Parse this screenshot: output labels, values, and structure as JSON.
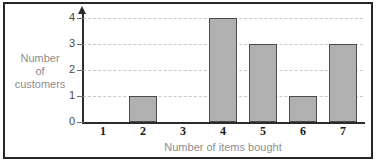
{
  "chart_data": {
    "type": "bar",
    "title": "",
    "categories": [
      "1",
      "2",
      "3",
      "4",
      "5",
      "6",
      "7"
    ],
    "values": [
      0,
      1,
      0,
      4,
      3,
      1,
      3
    ],
    "xlabel": "Number of items bought",
    "ylabel": "Number of customers",
    "ylabel_lines": [
      "Number",
      "of",
      "customers"
    ],
    "yticks": [
      "0",
      "1",
      "2",
      "3",
      "4"
    ],
    "ytick_values": [
      0,
      1,
      2,
      3,
      4
    ],
    "ylim": [
      0,
      4
    ],
    "grid": true,
    "grid_style": "dashed-horizontal",
    "legend": null,
    "colors": {
      "bar_fill": "#b0b0b0",
      "bar_edge": "#4c4c4c",
      "axis": "#2b2b2b",
      "grid": "#c9c9c9",
      "axis_title_text": "#8e8e8e",
      "ytick_text": "#4a4a4a",
      "xtick_text": "#1a1a1a",
      "frame": "#262626",
      "background": "#ffffff"
    }
  }
}
